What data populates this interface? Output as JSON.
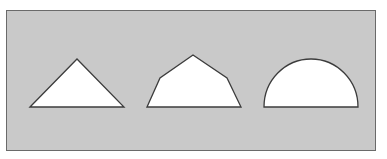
{
  "figure": {
    "background_color": "#ffffff",
    "panel": {
      "fill": "#c9c9c9",
      "border": "#6a6a6a"
    },
    "shape_style": {
      "fill": "#ffffff",
      "stroke": "#3c3c3c",
      "stroke_width": 1.3
    },
    "shapes": [
      {
        "name": "triangle",
        "type": "polygon",
        "points": "30,107 77,59 124,107"
      },
      {
        "name": "pentagon",
        "type": "polygon",
        "points": "147,107 160,78 193,55 227,78 241,107"
      },
      {
        "name": "semicircle",
        "type": "path",
        "d": "M 264 107 A 47 48 0 0 1 358 107 Z"
      }
    ]
  }
}
